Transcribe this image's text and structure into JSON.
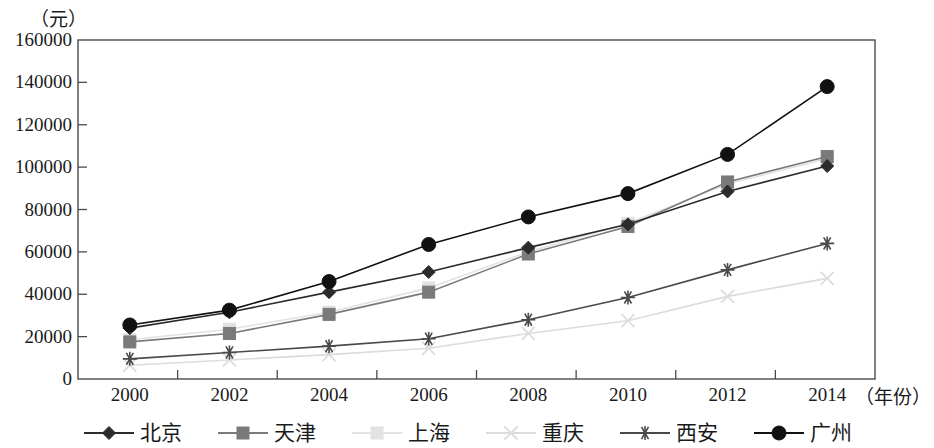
{
  "axis": {
    "y_unit_label": "（元）",
    "x_unit_label": "（年份）",
    "y_ticks": [
      "0",
      "20000",
      "40000",
      "60000",
      "80000",
      "100000",
      "120000",
      "140000",
      "160000"
    ],
    "x_ticks": [
      "2000",
      "2002",
      "2004",
      "2006",
      "2008",
      "2010",
      "2012",
      "2014"
    ]
  },
  "legend": {
    "items": [
      {
        "label": "北京",
        "marker": "diamond",
        "color": "#2b2b2b"
      },
      {
        "label": "天津",
        "marker": "square",
        "color": "#7a7a7a"
      },
      {
        "label": "上海",
        "marker": "dotted-square",
        "color": "#e2e2e2"
      },
      {
        "label": "重庆",
        "marker": "cross",
        "color": "#dcdcdc"
      },
      {
        "label": "西安",
        "marker": "asterisk",
        "color": "#4a4a4a"
      },
      {
        "label": "广州",
        "marker": "circle",
        "color": "#111111"
      }
    ]
  },
  "chart_data": {
    "type": "line",
    "title": "",
    "xlabel": "（年份）",
    "ylabel": "（元）",
    "categories": [
      "2000",
      "2002",
      "2004",
      "2006",
      "2008",
      "2010",
      "2012",
      "2014"
    ],
    "x": [
      2000,
      2002,
      2004,
      2006,
      2008,
      2010,
      2012,
      2014
    ],
    "ylim": [
      0,
      160000
    ],
    "ytick_step": 20000,
    "grid": false,
    "legend_position": "bottom",
    "series": [
      {
        "name": "北京",
        "marker": "diamond",
        "color": "#2b2b2b",
        "values": [
          24000,
          31500,
          41000,
          50500,
          62000,
          73000,
          88500,
          100500
        ]
      },
      {
        "name": "天津",
        "marker": "square",
        "color": "#7a7a7a",
        "values": [
          17500,
          21500,
          30500,
          41000,
          59000,
          72000,
          93000,
          105000
        ]
      },
      {
        "name": "上海",
        "marker": "dotted-square",
        "color": "#e2e2e2",
        "values": [
          18500,
          23500,
          31500,
          43000,
          60000,
          73500,
          92000,
          104000
        ]
      },
      {
        "name": "重庆",
        "marker": "cross",
        "color": "#dcdcdc",
        "values": [
          6500,
          9000,
          11500,
          14500,
          21500,
          27500,
          39000,
          47500
        ]
      },
      {
        "name": "西安",
        "marker": "asterisk",
        "color": "#4a4a4a",
        "values": [
          9500,
          12500,
          15500,
          19000,
          28000,
          38500,
          51500,
          64000
        ]
      },
      {
        "name": "广州",
        "marker": "circle",
        "color": "#111111",
        "values": [
          25500,
          32500,
          46000,
          63500,
          76500,
          87500,
          106000,
          138000
        ]
      }
    ]
  }
}
